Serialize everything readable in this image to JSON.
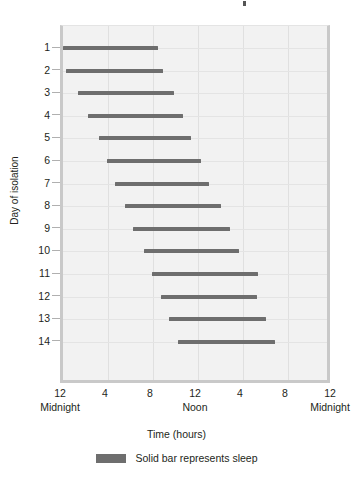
{
  "chart_data": {
    "type": "bar",
    "orientation": "horizontal-range",
    "title": "",
    "xlabel": "Time (hours)",
    "ylabel": "Day of isolation",
    "xlim": [
      0,
      24
    ],
    "ylim": [
      1,
      14
    ],
    "grid": true,
    "legend_position": "bottom-center",
    "legend": [
      {
        "label": "Solid bar represents sleep",
        "color": "#6e6e6e"
      }
    ],
    "x_ticks": [
      {
        "value": 0,
        "hour": "12",
        "period": "Midnight"
      },
      {
        "value": 4,
        "hour": "4",
        "period": ""
      },
      {
        "value": 8,
        "hour": "8",
        "period": ""
      },
      {
        "value": 12,
        "hour": "12",
        "period": "Noon"
      },
      {
        "value": 16,
        "hour": "4",
        "period": ""
      },
      {
        "value": 20,
        "hour": "8",
        "period": ""
      },
      {
        "value": 24,
        "hour": "12",
        "period": "Midnight"
      }
    ],
    "categories": [
      "1",
      "2",
      "3",
      "4",
      "5",
      "6",
      "7",
      "8",
      "9",
      "10",
      "11",
      "12",
      "13",
      "14"
    ],
    "bars": [
      {
        "day": "1",
        "start": 0.0,
        "end": 8.4
      },
      {
        "day": "2",
        "start": 0.3,
        "end": 8.9
      },
      {
        "day": "3",
        "start": 1.3,
        "end": 9.9
      },
      {
        "day": "4",
        "start": 2.2,
        "end": 10.7
      },
      {
        "day": "5",
        "start": 3.2,
        "end": 11.4
      },
      {
        "day": "6",
        "start": 3.9,
        "end": 12.3
      },
      {
        "day": "7",
        "start": 4.6,
        "end": 13.0
      },
      {
        "day": "8",
        "start": 5.5,
        "end": 14.0
      },
      {
        "day": "9",
        "start": 6.2,
        "end": 14.8
      },
      {
        "day": "10",
        "start": 7.2,
        "end": 15.6
      },
      {
        "day": "11",
        "start": 7.9,
        "end": 17.3
      },
      {
        "day": "12",
        "start": 8.7,
        "end": 17.2
      },
      {
        "day": "13",
        "start": 9.4,
        "end": 18.0
      },
      {
        "day": "14",
        "start": 10.2,
        "end": 18.8
      }
    ],
    "colors": {
      "bar": "#6e6e6e",
      "plot_background": "#f2f2f2",
      "gridline": "#e0e0e0",
      "axis": "#c9c9c9",
      "text": "#231f20"
    }
  }
}
